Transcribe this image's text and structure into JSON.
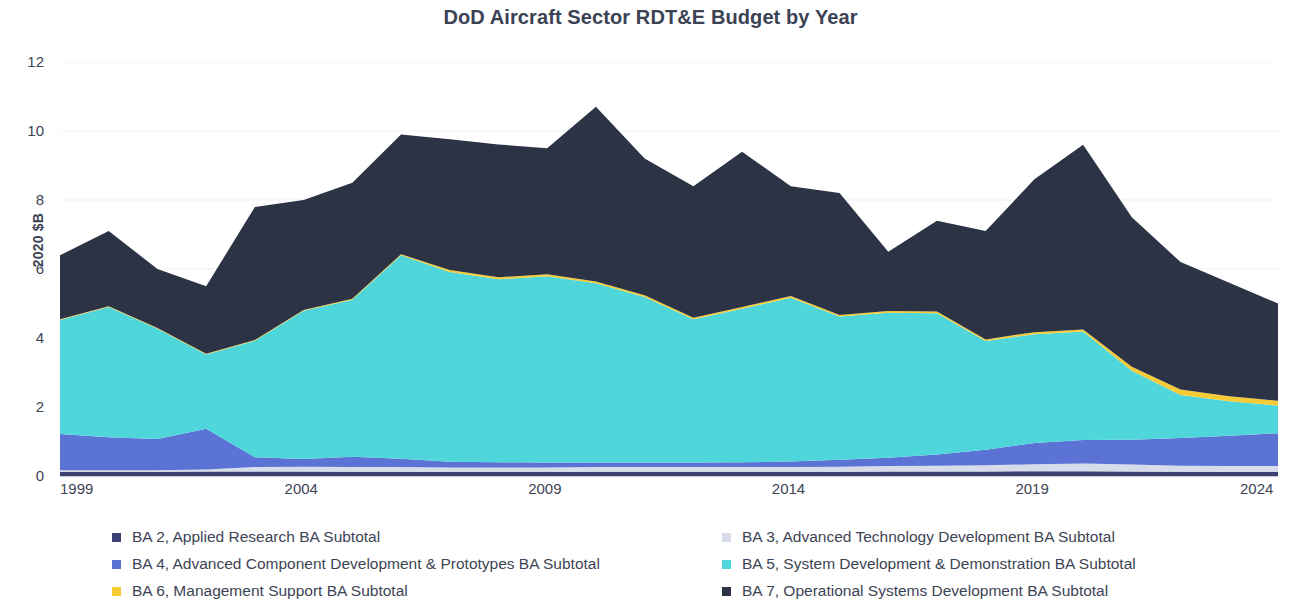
{
  "chart_data": {
    "type": "area",
    "stacked": true,
    "title": "DoD Aircraft Sector RDT&E Budget by Year",
    "xlabel": "",
    "ylabel": "2020 $B",
    "xlim": [
      1999,
      2024
    ],
    "ylim": [
      0,
      12
    ],
    "y_ticks": [
      0,
      2,
      4,
      6,
      8,
      10,
      12
    ],
    "x_ticks": [
      1999,
      2004,
      2009,
      2014,
      2019,
      2024
    ],
    "grid": "faint-horizontal",
    "legend_position": "bottom",
    "x": [
      1999,
      2000,
      2001,
      2002,
      2003,
      2004,
      2005,
      2006,
      2007,
      2008,
      2009,
      2010,
      2011,
      2012,
      2013,
      2014,
      2015,
      2016,
      2017,
      2018,
      2019,
      2020,
      2021,
      2022,
      2023,
      2024
    ],
    "series": [
      {
        "name": "BA 2, Applied Research BA Subtotal",
        "color": "#3b3f74",
        "values": [
          0.12,
          0.12,
          0.12,
          0.13,
          0.13,
          0.13,
          0.12,
          0.12,
          0.12,
          0.12,
          0.12,
          0.12,
          0.12,
          0.12,
          0.12,
          0.12,
          0.12,
          0.13,
          0.13,
          0.13,
          0.14,
          0.14,
          0.13,
          0.12,
          0.12,
          0.12
        ]
      },
      {
        "name": "BA 3, Advanced Technology Development BA Subtotal",
        "color": "#d6dcea",
        "values": [
          0.05,
          0.05,
          0.05,
          0.06,
          0.13,
          0.14,
          0.14,
          0.14,
          0.13,
          0.13,
          0.13,
          0.14,
          0.14,
          0.14,
          0.14,
          0.14,
          0.15,
          0.16,
          0.17,
          0.18,
          0.2,
          0.22,
          0.2,
          0.18,
          0.17,
          0.17
        ]
      },
      {
        "name": "BA 4, Advanced Component Development & Prototypes BA Subtotal",
        "color": "#5b73d4",
        "values": [
          1.05,
          0.95,
          0.9,
          1.18,
          0.28,
          0.22,
          0.3,
          0.24,
          0.16,
          0.15,
          0.14,
          0.13,
          0.13,
          0.13,
          0.14,
          0.16,
          0.2,
          0.24,
          0.32,
          0.45,
          0.62,
          0.68,
          0.72,
          0.8,
          0.88,
          0.95
        ]
      },
      {
        "name": "BA 5, System Development & Demonstration BA Subtotal",
        "color": "#4fd6da",
        "values": [
          3.3,
          3.78,
          3.2,
          2.15,
          3.38,
          4.3,
          4.55,
          5.9,
          5.5,
          5.3,
          5.4,
          5.2,
          4.8,
          4.15,
          4.45,
          4.75,
          4.15,
          4.2,
          4.1,
          3.15,
          3.15,
          3.15,
          2.0,
          1.25,
          1.0,
          0.8
        ]
      },
      {
        "name": "BA 6, Management Support BA Subtotal",
        "color": "#f5cc36",
        "values": [
          0.02,
          0.02,
          0.02,
          0.02,
          0.02,
          0.02,
          0.03,
          0.03,
          0.06,
          0.06,
          0.06,
          0.05,
          0.05,
          0.05,
          0.05,
          0.05,
          0.05,
          0.05,
          0.05,
          0.05,
          0.06,
          0.06,
          0.12,
          0.16,
          0.14,
          0.14
        ]
      },
      {
        "name": "BA 7, Operational Systems Development BA Subtotal",
        "color": "#2b3345",
        "values": [
          1.86,
          2.18,
          1.71,
          1.96,
          3.86,
          3.19,
          3.36,
          3.47,
          3.79,
          3.85,
          3.65,
          5.06,
          3.96,
          3.81,
          4.5,
          3.18,
          3.53,
          1.72,
          2.63,
          3.14,
          4.43,
          5.35,
          4.33,
          3.69,
          3.29,
          2.82
        ]
      }
    ],
    "totals": [
      6.4,
      7.1,
      6.0,
      5.5,
      7.8,
      8.0,
      8.5,
      9.9,
      9.76,
      9.81,
      9.5,
      10.7,
      9.2,
      8.4,
      9.4,
      8.4,
      8.2,
      6.5,
      7.4,
      7.1,
      8.6,
      9.6,
      7.5,
      6.2,
      5.6,
      5.0
    ]
  },
  "y_tick_labels": [
    "12",
    "10",
    "8",
    "6",
    "4",
    "2",
    "0"
  ],
  "x_tick_labels": [
    "1999",
    "2004",
    "2009",
    "2014",
    "2019",
    "2024"
  ],
  "legend": {
    "left_items": [
      {
        "label": "BA 2, Applied Research BA Subtotal",
        "color": "#3b3f74"
      },
      {
        "label": "BA 4, Advanced Component Development & Prototypes BA Subtotal",
        "color": "#5b73d4"
      },
      {
        "label": "BA 6, Management Support BA Subtotal",
        "color": "#f5cc36"
      }
    ],
    "right_items": [
      {
        "label": "BA 3, Advanced Technology Development BA Subtotal",
        "color": "#d6dcea"
      },
      {
        "label": "BA 5, System Development & Demonstration BA Subtotal",
        "color": "#4fd6da"
      },
      {
        "label": "BA 7, Operational Systems Development BA Subtotal",
        "color": "#2b3345"
      }
    ]
  }
}
